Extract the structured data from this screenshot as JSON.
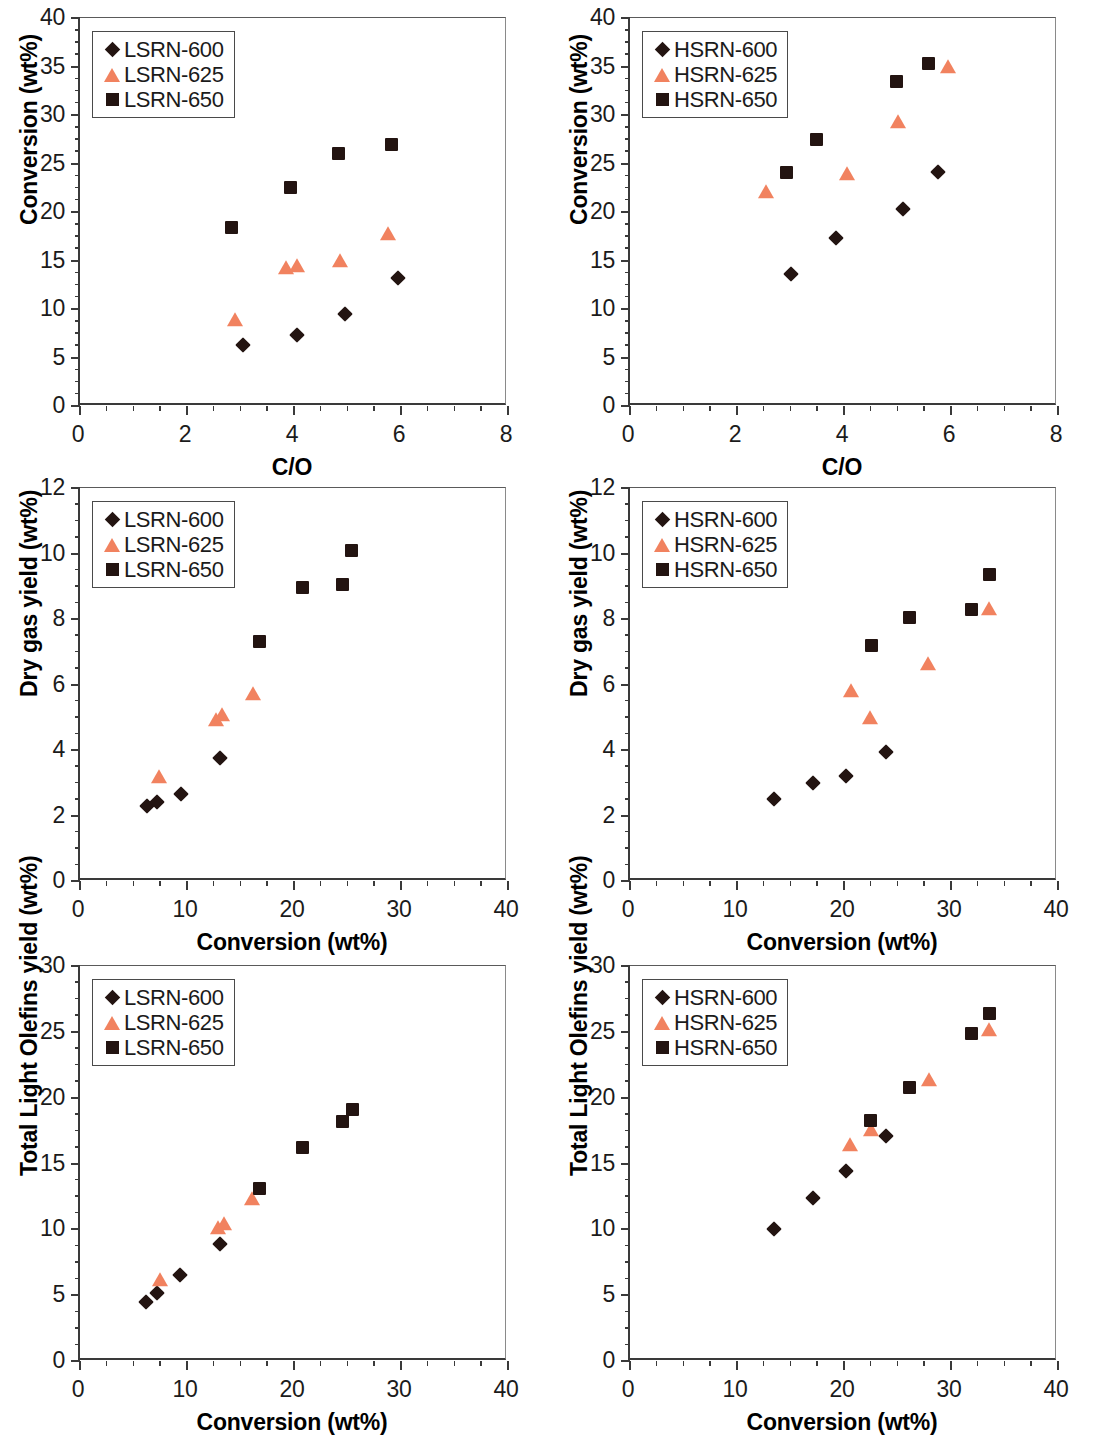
{
  "figure": {
    "marker_colors": {
      "dark": "#231411",
      "orange": "#F1825F"
    },
    "series_names": [
      "600",
      "625",
      "650"
    ]
  },
  "chart_data": [
    {
      "id": "panel-1",
      "type": "scatter",
      "title": "",
      "xlabel": "C/O",
      "ylabel": "Conversion (wt%)",
      "xlim": [
        0,
        8
      ],
      "ylim": [
        0,
        40
      ],
      "xticks": [
        0,
        2,
        4,
        6,
        8
      ],
      "yticks": [
        0,
        5,
        10,
        15,
        20,
        25,
        30,
        35,
        40
      ],
      "x_minor_step": 0.5,
      "y_minor_step": 1.25,
      "grid": false,
      "legend_position": "top-left",
      "series": [
        {
          "name": "LSRN-600",
          "marker": "diamond",
          "color": "#231411",
          "points": [
            [
              3.05,
              6.3
            ],
            [
              4.05,
              7.3
            ],
            [
              4.95,
              9.5
            ],
            [
              5.95,
              13.2
            ]
          ]
        },
        {
          "name": "LSRN-625",
          "marker": "triangle",
          "color": "#F1825F",
          "points": [
            [
              3.05,
              8.1
            ],
            [
              4.0,
              13.5
            ],
            [
              4.2,
              13.7
            ],
            [
              5.0,
              14.2
            ],
            [
              5.9,
              17.0
            ]
          ]
        },
        {
          "name": "LSRN-650",
          "marker": "square",
          "color": "#231411",
          "points": [
            [
              2.95,
              17.7
            ],
            [
              4.05,
              21.9
            ],
            [
              4.95,
              25.4
            ],
            [
              5.95,
              26.3
            ]
          ]
        }
      ]
    },
    {
      "id": "panel-2",
      "type": "scatter",
      "title": "",
      "xlabel": "C/O",
      "ylabel": "Conversion (wt%)",
      "xlim": [
        0,
        8
      ],
      "ylim": [
        0,
        40
      ],
      "xticks": [
        0,
        2,
        4,
        6,
        8
      ],
      "yticks": [
        0,
        5,
        10,
        15,
        20,
        25,
        30,
        35,
        40
      ],
      "x_minor_step": 0.5,
      "y_minor_step": 1.25,
      "grid": false,
      "legend_position": "top-left",
      "series": [
        {
          "name": "HSRN-600",
          "marker": "diamond",
          "color": "#231411",
          "points": [
            [
              3.0,
              13.6
            ],
            [
              3.85,
              17.3
            ],
            [
              5.1,
              20.3
            ],
            [
              5.75,
              24.1
            ]
          ]
        },
        {
          "name": "HSRN-625",
          "marker": "triangle",
          "color": "#F1825F",
          "points": [
            [
              2.7,
              21.3
            ],
            [
              4.2,
              23.2
            ],
            [
              5.15,
              28.6
            ],
            [
              6.1,
              34.2
            ]
          ]
        },
        {
          "name": "HSRN-650",
          "marker": "square",
          "color": "#231411",
          "points": [
            [
              3.05,
              23.4
            ],
            [
              3.6,
              26.8
            ],
            [
              5.1,
              32.8
            ],
            [
              5.7,
              34.6
            ]
          ]
        }
      ]
    },
    {
      "id": "panel-3",
      "type": "scatter",
      "title": "",
      "xlabel": "Conversion (wt%)",
      "ylabel": "Dry gas yield (wt%)",
      "xlim": [
        0,
        40
      ],
      "ylim": [
        0,
        12
      ],
      "xticks": [
        0,
        10,
        20,
        30,
        40
      ],
      "yticks": [
        0,
        2,
        4,
        6,
        8,
        10,
        12
      ],
      "x_minor_step": 2.5,
      "y_minor_step": 0.5,
      "grid": false,
      "legend_position": "top-left",
      "series": [
        {
          "name": "LSRN-600",
          "marker": "diamond",
          "color": "#231411",
          "points": [
            [
              6.3,
              2.3
            ],
            [
              7.2,
              2.4
            ],
            [
              9.4,
              2.65
            ],
            [
              13.1,
              3.75
            ]
          ]
        },
        {
          "name": "LSRN-625",
          "marker": "triangle",
          "color": "#F1825F",
          "points": [
            [
              8.1,
              2.95
            ],
            [
              13.5,
              4.7
            ],
            [
              14.0,
              4.85
            ],
            [
              16.9,
              5.5
            ]
          ]
        },
        {
          "name": "LSRN-650",
          "marker": "square",
          "color": "#231411",
          "points": [
            [
              17.4,
              7.1
            ],
            [
              21.4,
              8.75
            ],
            [
              25.1,
              8.85
            ],
            [
              26.0,
              9.9
            ]
          ]
        }
      ]
    },
    {
      "id": "panel-4",
      "type": "scatter",
      "title": "",
      "xlabel": "Conversion (wt%)",
      "ylabel": "Dry gas yield (wt%)",
      "xlim": [
        0,
        40
      ],
      "ylim": [
        0,
        12
      ],
      "xticks": [
        0,
        10,
        20,
        30,
        40
      ],
      "yticks": [
        0,
        2,
        4,
        6,
        8,
        10,
        12
      ],
      "x_minor_step": 2.5,
      "y_minor_step": 0.5,
      "grid": false,
      "legend_position": "top-left",
      "series": [
        {
          "name": "HSRN-600",
          "marker": "diamond",
          "color": "#231411",
          "points": [
            [
              13.5,
              2.5
            ],
            [
              17.1,
              3.0
            ],
            [
              20.2,
              3.2
            ],
            [
              23.9,
              3.95
            ]
          ]
        },
        {
          "name": "HSRN-625",
          "marker": "triangle",
          "color": "#F1825F",
          "points": [
            [
              21.4,
              5.6
            ],
            [
              23.2,
              4.75
            ],
            [
              28.6,
              6.4
            ],
            [
              34.3,
              8.1
            ]
          ]
        },
        {
          "name": "HSRN-650",
          "marker": "square",
          "color": "#231411",
          "points": [
            [
              23.2,
              7.0
            ],
            [
              26.7,
              7.85
            ],
            [
              32.5,
              8.1
            ],
            [
              34.2,
              9.15
            ]
          ]
        }
      ]
    },
    {
      "id": "panel-5",
      "type": "scatter",
      "title": "",
      "xlabel": "Conversion (wt%)",
      "ylabel": "Total Light Olefins yield (wt%)",
      "xlim": [
        0,
        40
      ],
      "ylim": [
        0,
        30
      ],
      "xticks": [
        0,
        10,
        20,
        30,
        40
      ],
      "yticks": [
        0,
        5,
        10,
        15,
        20,
        25,
        30
      ],
      "x_minor_step": 2.5,
      "y_minor_step": 1.25,
      "grid": false,
      "legend_position": "top-left",
      "series": [
        {
          "name": "LSRN-600",
          "marker": "diamond",
          "color": "#231411",
          "points": [
            [
              6.2,
              4.5
            ],
            [
              7.2,
              5.2
            ],
            [
              9.3,
              6.5
            ],
            [
              13.1,
              8.9
            ]
          ]
        },
        {
          "name": "LSRN-625",
          "marker": "triangle",
          "color": "#F1825F",
          "points": [
            [
              8.2,
              5.6
            ],
            [
              13.6,
              9.6
            ],
            [
              14.2,
              9.9
            ],
            [
              16.8,
              11.8
            ]
          ]
        },
        {
          "name": "LSRN-650",
          "marker": "square",
          "color": "#231411",
          "points": [
            [
              17.4,
              12.6
            ],
            [
              21.4,
              15.7
            ],
            [
              25.1,
              17.7
            ],
            [
              26.1,
              18.6
            ]
          ]
        }
      ]
    },
    {
      "id": "panel-6",
      "type": "scatter",
      "title": "",
      "xlabel": "Conversion (wt%)",
      "ylabel": "Total Light Olefins yield (wt%)",
      "xlim": [
        0,
        40
      ],
      "ylim": [
        0,
        30
      ],
      "xticks": [
        0,
        10,
        20,
        30,
        40
      ],
      "yticks": [
        0,
        5,
        10,
        15,
        20,
        25,
        30
      ],
      "x_minor_step": 2.5,
      "y_minor_step": 1.25,
      "grid": false,
      "legend_position": "top-left",
      "series": [
        {
          "name": "HSRN-600",
          "marker": "diamond",
          "color": "#231411",
          "points": [
            [
              13.5,
              10.0
            ],
            [
              17.1,
              12.4
            ],
            [
              20.2,
              14.4
            ],
            [
              23.9,
              17.1
            ]
          ]
        },
        {
          "name": "HSRN-625",
          "marker": "triangle",
          "color": "#F1825F",
          "points": [
            [
              21.3,
              15.9
            ],
            [
              23.3,
              17.0
            ],
            [
              28.7,
              20.8
            ],
            [
              34.3,
              24.6
            ]
          ]
        },
        {
          "name": "HSRN-650",
          "marker": "square",
          "color": "#231411",
          "points": [
            [
              23.1,
              17.8
            ],
            [
              26.7,
              20.3
            ],
            [
              32.5,
              24.4
            ],
            [
              34.2,
              25.9
            ]
          ]
        }
      ]
    }
  ]
}
